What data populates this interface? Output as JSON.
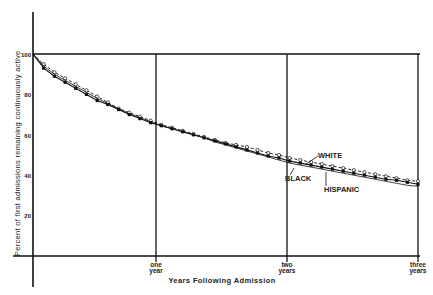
{
  "chart_data": {
    "type": "line",
    "title": "",
    "xlabel": "Years Following Admission",
    "ylabel": "Percent of first admissions remaining continuously active",
    "ylim": [
      0,
      100
    ],
    "xlim": [
      0,
      3
    ],
    "y_ticks": [
      20,
      40,
      60,
      80,
      100
    ],
    "x_ticks": [
      {
        "value": 1,
        "label_line1": "one",
        "label_line2": "year"
      },
      {
        "value": 2,
        "label_line1": "two",
        "label_line2": "years"
      },
      {
        "value": 3,
        "label_line1": "three",
        "label_line2": "years"
      }
    ],
    "grid": "vertical lines at each year, horizontal line at 100",
    "legend": "inline labels",
    "x": [
      0,
      0.083,
      0.167,
      0.25,
      0.333,
      0.417,
      0.5,
      0.583,
      0.667,
      0.75,
      0.833,
      0.917,
      1.0,
      1.083,
      1.167,
      1.25,
      1.333,
      1.417,
      1.5,
      1.583,
      1.667,
      1.75,
      1.833,
      1.917,
      2.0,
      2.083,
      2.167,
      2.25,
      2.333,
      2.417,
      2.5,
      2.583,
      2.667,
      2.75,
      2.833,
      2.917,
      3.0
    ],
    "series": [
      {
        "name": "WHITE",
        "style": "dashed, open circles",
        "values": [
          100,
          95,
          91,
          88,
          85,
          82,
          79,
          76,
          73,
          71,
          69,
          67,
          65,
          63.5,
          62,
          60.5,
          59,
          57.5,
          56,
          55,
          54,
          52.5,
          51,
          50,
          48.5,
          47.5,
          46.5,
          45.5,
          44.5,
          43.5,
          42.5,
          41.5,
          40.5,
          39.5,
          38.5,
          37.5,
          37
        ]
      },
      {
        "name": "BLACK",
        "style": "solid, filled squares",
        "values": [
          100,
          93,
          89,
          86,
          83,
          80,
          77,
          75,
          72.5,
          70,
          68,
          66,
          64.5,
          63,
          61.5,
          60,
          58.5,
          57,
          55.5,
          54,
          52.5,
          51,
          49.5,
          48.5,
          47,
          46,
          45,
          44,
          43,
          42,
          41,
          40,
          39,
          38,
          37.5,
          36.5,
          35.5
        ]
      },
      {
        "name": "HISPANIC",
        "style": "solid thin",
        "values": [
          100,
          94,
          90,
          87,
          84,
          81,
          78,
          75.5,
          73,
          70.5,
          68.5,
          66.5,
          64.5,
          63,
          61.5,
          60,
          58.5,
          56.5,
          55,
          53.5,
          52,
          50.5,
          49,
          47.5,
          46,
          45,
          44,
          43,
          42,
          41,
          40,
          39,
          38,
          37,
          36,
          35,
          34.5
        ]
      }
    ]
  },
  "labels": {
    "ylabel": "Percent of first admissions remaining continuously active",
    "xlabel": "Years Following Admission",
    "y100": "100",
    "y80": "80",
    "y60": "60",
    "y40": "40",
    "y20": "20",
    "x1a": "one",
    "x1b": "year",
    "x2a": "two",
    "x2b": "years",
    "x3a": "three",
    "x3b": "years",
    "white": "WHITE",
    "black": "BLACK",
    "hispanic": "HISPANIC"
  }
}
